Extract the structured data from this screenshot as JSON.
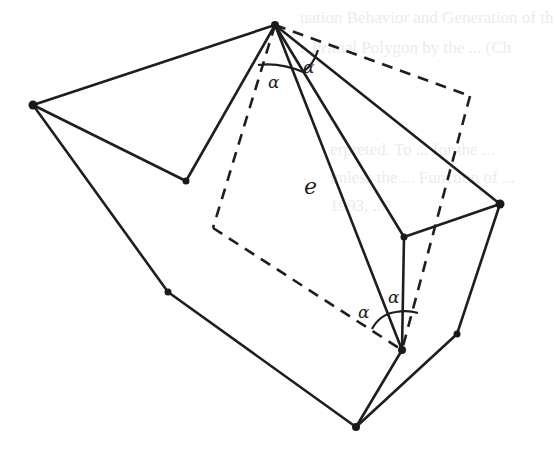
{
  "figure": {
    "labels": {
      "alpha_top_left": "α",
      "alpha_top_right": "α",
      "alpha_bottom_left": "α",
      "alpha_bottom_right": "α",
      "edge_e": "e"
    },
    "bleed_through_text": [
      "uation Behavior and Generation of th",
      "e Primal Polygon by the ... (Ch",
      "erpreted. To ... for the ...",
      "unless the ... Function of ...",
      "1993, ..."
    ],
    "vertices": [
      {
        "id": "apex",
        "x": 275,
        "y": 25
      },
      {
        "id": "left",
        "x": 33,
        "y": 105
      },
      {
        "id": "inner-left",
        "x": 186,
        "y": 181
      },
      {
        "id": "lower-left",
        "x": 168,
        "y": 292
      },
      {
        "id": "bottom",
        "x": 356,
        "y": 427
      },
      {
        "id": "pivot",
        "x": 402,
        "y": 350
      },
      {
        "id": "lower-right",
        "x": 457,
        "y": 334
      },
      {
        "id": "right",
        "x": 500,
        "y": 204
      },
      {
        "id": "inner-right",
        "x": 404,
        "y": 237
      }
    ],
    "colors": {
      "ink": "#1e1e1e",
      "background": "#ffffff"
    }
  }
}
